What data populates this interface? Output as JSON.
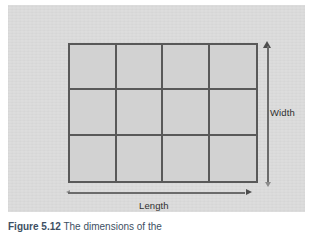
{
  "figure": {
    "panel_bg": "#d9d9d9",
    "line_color": "#595959",
    "text_color": "#2f2f2f",
    "caption_color": "#3d4f63",
    "caption_number": "Figure 5.12",
    "caption_text": "The dimensions of the",
    "caption_full": "Figure 5.12 The dimensions of the"
  },
  "diagram": {
    "title": "",
    "shape": "rectangle-grid",
    "grid": {
      "columns": 4,
      "rows": 3,
      "cell_count": 12,
      "fill_color": "#d2d2d2",
      "border_color": "#595959"
    },
    "dimension_labels": {
      "vertical": "Width",
      "horizontal": "Length"
    },
    "arrows": [
      {
        "name": "width-arrow",
        "orientation": "vertical",
        "label": "Width",
        "position": "right",
        "head": "up"
      },
      {
        "name": "length-arrow",
        "orientation": "horizontal",
        "label": "Length",
        "position": "bottom",
        "head": "right"
      }
    ]
  }
}
